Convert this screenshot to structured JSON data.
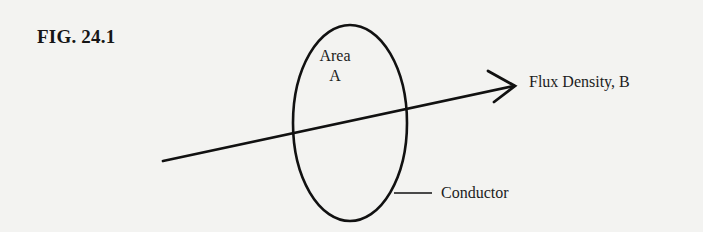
{
  "figure": {
    "title": "FIG. 24.1"
  },
  "labels": {
    "area_line1": "Area",
    "area_line2": "A",
    "flux_density": "Flux Density, B",
    "conductor": "Conductor"
  },
  "colors": {
    "background": "#f3f3f1",
    "ink": "#111111"
  },
  "shapes": {
    "conductor_loop": {
      "type": "ellipse",
      "cx": 350,
      "cy": 123,
      "rx": 57,
      "ry": 98
    },
    "flux_arrow": {
      "from": [
        163,
        161
      ],
      "to": [
        515,
        86
      ]
    },
    "conductor_leader": {
      "from": [
        394,
        193
      ],
      "to": [
        432,
        193
      ]
    }
  }
}
